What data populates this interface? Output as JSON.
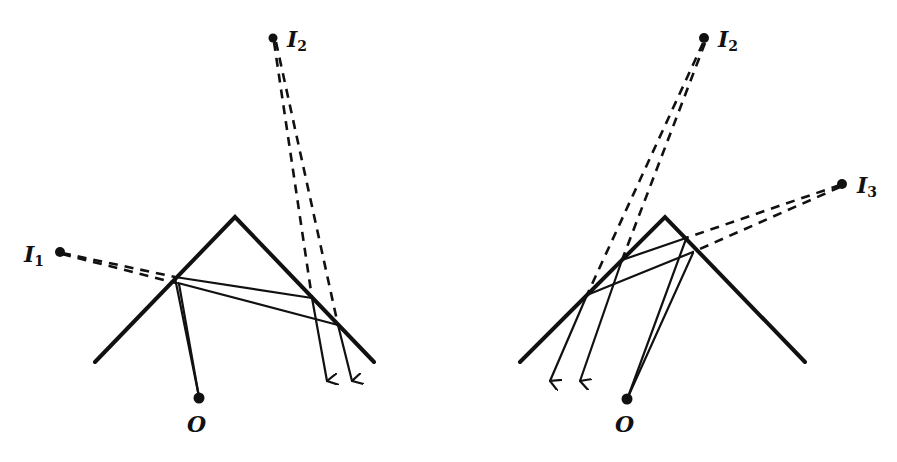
{
  "figure": {
    "background": "#ffffff",
    "ink_color": "#111111",
    "panels": [
      {
        "id": "left",
        "prism": {
          "apex": [
            235,
            217
          ],
          "left_end": [
            95,
            362
          ],
          "right_end": [
            374,
            362
          ]
        },
        "points": [
          {
            "name": "I1",
            "label": "I",
            "subscript": "1",
            "dot": [
              60,
              252
            ],
            "label_pos": [
              24,
              262
            ]
          },
          {
            "name": "I2",
            "label": "I",
            "subscript": "2",
            "dot": [
              273,
              38
            ],
            "label_pos": [
              287,
              47
            ]
          },
          {
            "name": "O",
            "label": "O",
            "subscript": "",
            "dot": [
              199,
              398
            ],
            "label_pos": [
              187,
              432
            ]
          }
        ]
      },
      {
        "id": "right",
        "prism": {
          "apex": [
            665,
            217
          ],
          "left_end": [
            520,
            362
          ],
          "right_end": [
            805,
            362
          ]
        },
        "points": [
          {
            "name": "I2",
            "label": "I",
            "subscript": "2",
            "dot": [
              704,
              38
            ],
            "label_pos": [
              718,
              47
            ]
          },
          {
            "name": "I3",
            "label": "I",
            "subscript": "3",
            "dot": [
              842,
              184
            ],
            "label_pos": [
              857,
              193
            ]
          },
          {
            "name": "O",
            "label": "O",
            "subscript": "",
            "dot": [
              627,
              399
            ],
            "label_pos": [
              615,
              432
            ]
          }
        ]
      }
    ]
  },
  "labels": {
    "left_I1": "I",
    "left_I1_sub": "1",
    "left_I2": "I",
    "left_I2_sub": "2",
    "left_O": "O",
    "right_I2": "I",
    "right_I2_sub": "2",
    "right_I3": "I",
    "right_I3_sub": "3",
    "right_O": "O"
  }
}
